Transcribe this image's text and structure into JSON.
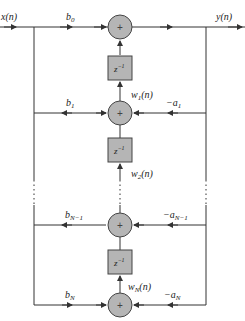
{
  "diagram": {
    "input_label": "x(n)",
    "output_label": "y(n)",
    "summer_symbol": "+",
    "delay_label": "z",
    "delay_exponent": "−1",
    "colors": {
      "line": "#333333",
      "summer_fill": "#b5b5b5",
      "delay_fill": "#b5b5b5"
    },
    "stages": [
      {
        "b": "b",
        "b_sub": "0",
        "a": "",
        "a_sub": "",
        "w": "",
        "w_sub": ""
      },
      {
        "b": "b",
        "b_sub": "1",
        "a": "−a",
        "a_sub": "1",
        "w": "w",
        "w_sub": "1",
        "w_suffix": "(n)"
      },
      {
        "b": "b",
        "b_sub": "N−1",
        "a": "−a",
        "a_sub": "N−1",
        "w": "w",
        "w_sub": "2",
        "w_suffix": "(n)"
      },
      {
        "b": "b",
        "b_sub": "N",
        "a": "−a",
        "a_sub": "N",
        "w": "w",
        "w_sub": "N",
        "w_suffix": "(n)"
      }
    ]
  }
}
